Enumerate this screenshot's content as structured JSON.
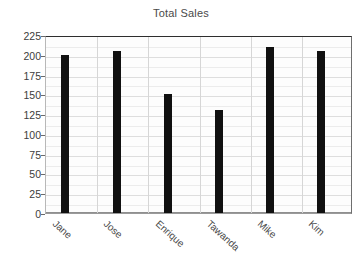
{
  "chart_data": {
    "type": "bar",
    "title": "Total Sales",
    "xlabel": "",
    "ylabel": "",
    "categories": [
      "Jane",
      "Jose",
      "Enrique",
      "Tawanda",
      "Mike",
      "Kim"
    ],
    "values": [
      200,
      205,
      150,
      130,
      210,
      205
    ],
    "ylim": [
      0,
      225
    ],
    "ytick_labels": [
      "225",
      "200",
      "175",
      "150",
      "125",
      "100",
      "75",
      "50",
      "25",
      "0"
    ],
    "ytick_values": [
      225,
      200,
      175,
      150,
      125,
      100,
      75,
      50,
      25,
      0
    ],
    "ytick_step": 25,
    "grid": true,
    "legend": false,
    "bar_color": "#111111",
    "plot_background": "#fdfdfd",
    "gridline_color": "#dedede",
    "text_color": "#4a4a4a",
    "xtick_label_rotation": 42
  }
}
